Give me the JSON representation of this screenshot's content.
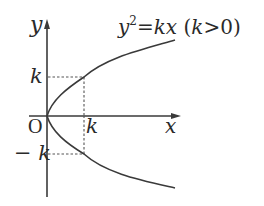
{
  "diagram": {
    "type": "parabola-graph",
    "equation": {
      "lhs_base": "y",
      "lhs_exponent": "2",
      "equals": "=",
      "rhs": "kx",
      "condition": "(k>0)",
      "condition_open": "(",
      "condition_var": "k",
      "condition_rest": ">0)"
    },
    "axes": {
      "x_label": "x",
      "y_label": "y",
      "origin_label": "O"
    },
    "markers": {
      "x_tick_label": "k",
      "y_tick_label": "k",
      "y_neg_tick_label": "− k"
    },
    "colors": {
      "stroke": "#3a3a3a",
      "dashed": "#555555",
      "text": "#2a2a2a"
    }
  }
}
